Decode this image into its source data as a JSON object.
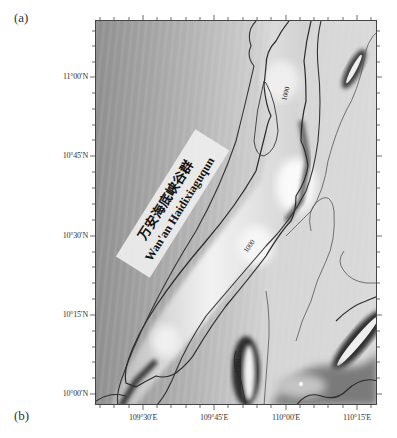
{
  "figure": {
    "panel_labels": {
      "a": "(a)",
      "b": "(b)"
    },
    "map": {
      "type": "bathymetric shaded relief map",
      "feature_label_cn": "万安海底峡谷群",
      "feature_label_en": "Wan'an Haidixiaguqun",
      "contour_labels": [
        "1000",
        "1000",
        "1000"
      ],
      "colormap": "grayscale",
      "colors": {
        "frame": "#444444",
        "contour_major": "#2a2a2a",
        "contour_minor": "#555555",
        "label_band": "#eeeeee"
      }
    },
    "axes": {
      "lat_labels": [
        "11°00′N",
        "10°45′N",
        "10°30′N",
        "10°15′N",
        "10°00′N"
      ],
      "lon_labels": [
        "109°30′E",
        "109°45′E",
        "110°00′E",
        "110°15′E"
      ]
    }
  }
}
